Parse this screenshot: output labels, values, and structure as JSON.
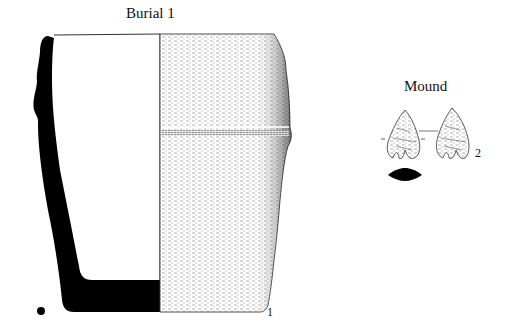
{
  "figure": {
    "left_panel": {
      "title": "Burial 1",
      "item_number": "1",
      "object": "ceramic vessel (profile section and exterior view)"
    },
    "right_panel": {
      "title": "Mound",
      "item_number": "2",
      "object": "projectile point (two faces and cross-section)"
    },
    "colors": {
      "ink": "#000000",
      "background": "#ffffff"
    }
  }
}
